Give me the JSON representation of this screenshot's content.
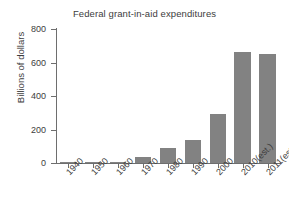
{
  "chart_data": {
    "type": "bar",
    "title": "Federal grant-in-aid expenditures",
    "xlabel": "",
    "ylabel": "Billions of dollars",
    "categories": [
      "1940",
      "1950",
      "1960",
      "1970",
      "1980",
      "1990",
      "2000",
      "2010(est.)",
      "2011(est.)"
    ],
    "values": [
      1,
      2,
      7,
      35,
      90,
      135,
      290,
      660,
      650
    ],
    "ylim": [
      0,
      800
    ],
    "yticks": [
      0,
      200,
      400,
      600,
      800
    ],
    "ytick_labels": [
      "0",
      "200",
      "400",
      "600",
      "800"
    ],
    "grid": false,
    "legend": false,
    "bar_color": "#828282",
    "axis_color": "#6e6e6e",
    "text_color": "#3d3d3d"
  }
}
